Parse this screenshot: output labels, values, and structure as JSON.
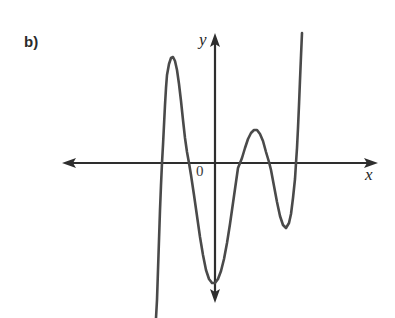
{
  "figure": {
    "panel_label": "b)",
    "origin_label": "0",
    "axis_x_label": "x",
    "axis_y_label": "y",
    "background_color": "#ffffff",
    "curve_color": "#4a4a4a",
    "axis_color": "#2e2e2e",
    "label_color": "#2b2b2b"
  },
  "chart_data": {
    "type": "line",
    "title": "",
    "subtitle": "",
    "xlabel": "x",
    "ylabel": "y",
    "grid": false,
    "legend": null,
    "axes": {
      "x_axis": {
        "pixel_y": 163,
        "pixel_x_start": 62,
        "pixel_x_end": 378,
        "arrow_both_ends": true,
        "ticks": [],
        "tick_labels": []
      },
      "y_axis": {
        "pixel_x": 215,
        "pixel_y_start": 33,
        "pixel_y_end": 303,
        "arrow_both_ends": true,
        "ticks": [],
        "tick_labels": []
      }
    },
    "x_intercepts_px": [
      160,
      190,
      237,
      270,
      297
    ],
    "critical_points_px": [
      {
        "kind": "local-maximum",
        "x": 172,
        "y": 57
      },
      {
        "kind": "local-minimum",
        "x": 212,
        "y": 283
      },
      {
        "kind": "local-maximum",
        "x": 255,
        "y": 130
      },
      {
        "kind": "local-minimum",
        "x": 285,
        "y": 228
      }
    ],
    "curve_points_px": [
      [
        156,
        318
      ],
      [
        157,
        300
      ],
      [
        158,
        270
      ],
      [
        159,
        240
      ],
      [
        160,
        210
      ],
      [
        161,
        185
      ],
      [
        162,
        163
      ],
      [
        163,
        145
      ],
      [
        164,
        125
      ],
      [
        165,
        105
      ],
      [
        166,
        88
      ],
      [
        167,
        75
      ],
      [
        169,
        64
      ],
      [
        171,
        58
      ],
      [
        173,
        57
      ],
      [
        175,
        61
      ],
      [
        177,
        70
      ],
      [
        179,
        84
      ],
      [
        181,
        101
      ],
      [
        183,
        120
      ],
      [
        185,
        138
      ],
      [
        187,
        152
      ],
      [
        189,
        163
      ],
      [
        191,
        175
      ],
      [
        194,
        195
      ],
      [
        197,
        216
      ],
      [
        200,
        237
      ],
      [
        203,
        255
      ],
      [
        206,
        270
      ],
      [
        209,
        279
      ],
      [
        212,
        283
      ],
      [
        215,
        283
      ],
      [
        218,
        279
      ],
      [
        221,
        271
      ],
      [
        224,
        259
      ],
      [
        227,
        243
      ],
      [
        230,
        224
      ],
      [
        233,
        203
      ],
      [
        236,
        182
      ],
      [
        238,
        168
      ],
      [
        240,
        163
      ],
      [
        242,
        158
      ],
      [
        245,
        148
      ],
      [
        248,
        139
      ],
      [
        251,
        133
      ],
      [
        254,
        130
      ],
      [
        257,
        130
      ],
      [
        260,
        134
      ],
      [
        263,
        141
      ],
      [
        266,
        152
      ],
      [
        269,
        162
      ],
      [
        271,
        170
      ],
      [
        274,
        186
      ],
      [
        277,
        202
      ],
      [
        280,
        216
      ],
      [
        283,
        225
      ],
      [
        286,
        228
      ],
      [
        289,
        223
      ],
      [
        291,
        214
      ],
      [
        293,
        198
      ],
      [
        295,
        179
      ],
      [
        296,
        163
      ],
      [
        297,
        148
      ],
      [
        298,
        128
      ],
      [
        299,
        105
      ],
      [
        300,
        80
      ],
      [
        301,
        56
      ],
      [
        302,
        33
      ]
    ],
    "series": [
      {
        "name": "polynomial",
        "x": [
          156,
          160,
          166,
          172,
          180,
          190,
          200,
          212,
          224,
          236,
          246,
          255,
          266,
          276,
          285,
          293,
          298,
          302
        ],
        "y": [
          318,
          210,
          88,
          57,
          92,
          168,
          237,
          283,
          259,
          182,
          145,
          130,
          152,
          196,
          228,
          206,
          128,
          33
        ]
      }
    ]
  }
}
